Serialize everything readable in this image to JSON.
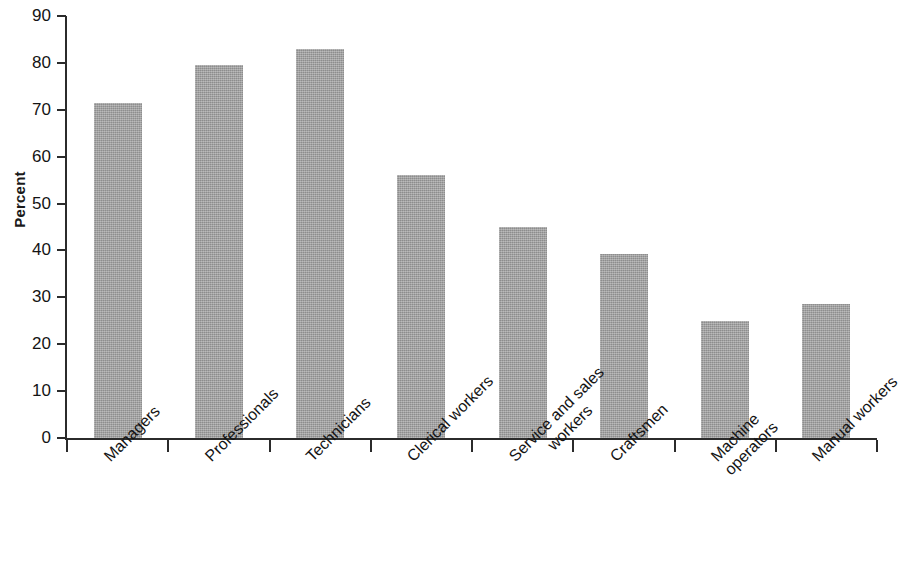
{
  "chart_data": {
    "type": "bar",
    "title": "",
    "xlabel": "",
    "ylabel": "Percent",
    "ylim": [
      0,
      90
    ],
    "ytick_step": 10,
    "yticks": [
      0,
      10,
      20,
      30,
      40,
      50,
      60,
      70,
      80,
      90
    ],
    "ytick_labels": [
      "0",
      "10",
      "20",
      "30",
      "40",
      "50",
      "60",
      "70",
      "80",
      "90"
    ],
    "grid": false,
    "legend": false,
    "bar_color": "#a1a1a1",
    "axis_color": "#2b2b2b",
    "categories": [
      "Managers",
      "Professionals",
      "Technicians",
      "Clerical workers",
      "Service and sales workers",
      "Craftsmen",
      "Machine operators",
      "Manual workers"
    ],
    "category_label_lines": [
      [
        "Managers"
      ],
      [
        "Professionals"
      ],
      [
        "Technicians"
      ],
      [
        "Clerical workers"
      ],
      [
        "Service and sales",
        "workers"
      ],
      [
        "Craftsmen"
      ],
      [
        "Machine",
        "operators"
      ],
      [
        "Manual workers"
      ]
    ],
    "values": [
      71.4,
      79.5,
      83.0,
      56.0,
      45.0,
      39.3,
      25.0,
      28.5
    ],
    "value_unit": "percent"
  }
}
